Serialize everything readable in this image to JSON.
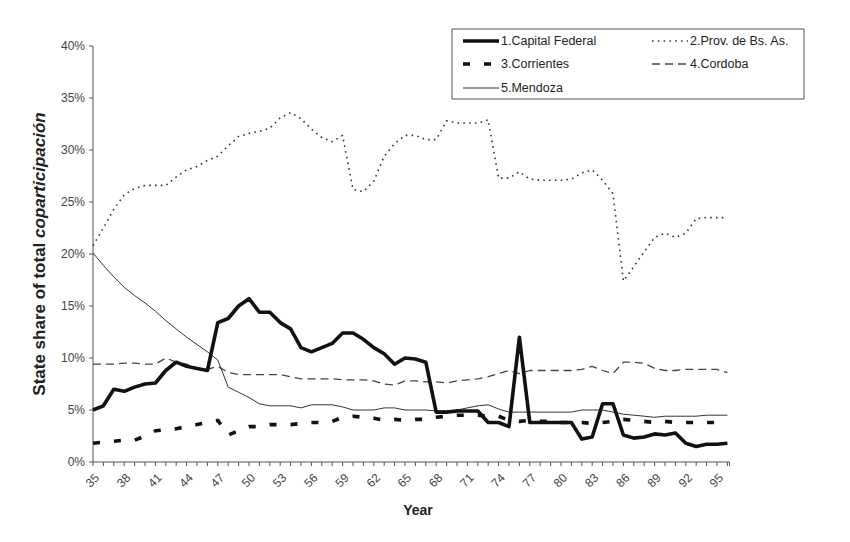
{
  "chart_data": {
    "type": "line",
    "title": "",
    "xlabel": "Year",
    "ylabel_prefix": "State share of total ",
    "ylabel_italic": "coparticipación",
    "ylim": [
      0,
      40
    ],
    "yticks": [
      "0%",
      "5%",
      "10%",
      "15%",
      "20%",
      "25%",
      "30%",
      "35%",
      "40%"
    ],
    "xrange": [
      35,
      96
    ],
    "xtick_labels": [
      "35",
      "38",
      "41",
      "44",
      "47",
      "50",
      "53",
      "56",
      "59",
      "62",
      "65",
      "68",
      "71",
      "74",
      "77",
      "80",
      "83",
      "86",
      "89",
      "92",
      "95"
    ],
    "grid": false,
    "legend_position": "top-right",
    "x": [
      35,
      36,
      37,
      38,
      39,
      40,
      41,
      42,
      43,
      44,
      45,
      46,
      47,
      48,
      49,
      50,
      51,
      52,
      53,
      54,
      55,
      56,
      57,
      58,
      59,
      60,
      61,
      62,
      63,
      64,
      65,
      66,
      67,
      68,
      69,
      70,
      71,
      72,
      73,
      74,
      75,
      76,
      77,
      78,
      79,
      80,
      81,
      82,
      83,
      84,
      85,
      86,
      87,
      88,
      89,
      90,
      91,
      92,
      93,
      94,
      95,
      96
    ],
    "series": [
      {
        "name": "1.Capital Federal",
        "style": "thick-solid",
        "values": [
          5.0,
          5.4,
          7.0,
          6.8,
          7.2,
          7.5,
          7.6,
          8.8,
          9.6,
          9.2,
          9.0,
          8.8,
          13.4,
          13.8,
          15.0,
          15.7,
          14.4,
          14.4,
          13.4,
          12.8,
          11.0,
          10.6,
          11.0,
          11.4,
          12.4,
          12.4,
          11.8,
          11.0,
          10.4,
          9.4,
          10.0,
          9.9,
          9.6,
          4.8,
          4.8,
          4.9,
          4.9,
          4.9,
          3.8,
          3.8,
          3.4,
          12.0,
          3.8,
          3.8,
          3.8,
          3.8,
          3.8,
          2.2,
          2.4,
          5.6,
          5.6,
          2.6,
          2.3,
          2.4,
          2.7,
          2.6,
          2.8,
          1.8,
          1.5,
          1.7,
          1.7,
          1.8
        ]
      },
      {
        "name": "2.Prov. de Bs. As.",
        "style": "dotted",
        "values": [
          20.8,
          22.5,
          24.3,
          25.7,
          26.3,
          26.6,
          26.6,
          26.6,
          27.4,
          28.1,
          28.4,
          29.0,
          29.4,
          30.4,
          31.3,
          31.6,
          31.8,
          32.1,
          33.1,
          33.6,
          33.0,
          32.0,
          31.2,
          30.8,
          31.4,
          26.2,
          26.0,
          27.0,
          29.4,
          30.6,
          31.4,
          31.4,
          31.0,
          31.0,
          32.8,
          32.6,
          32.6,
          32.6,
          32.9,
          27.3,
          27.3,
          27.9,
          27.2,
          27.1,
          27.1,
          27.1,
          27.2,
          27.8,
          28.1,
          27.1,
          25.8,
          17.4,
          18.8,
          20.2,
          21.6,
          22.0,
          21.6,
          22.0,
          23.4,
          23.5,
          23.5,
          23.5
        ]
      },
      {
        "name": "3.Corrientes",
        "style": "thick-dashed",
        "values": [
          1.8,
          1.9,
          2.0,
          2.1,
          2.1,
          2.5,
          3.0,
          3.1,
          3.2,
          3.4,
          3.6,
          3.8,
          4.0,
          2.6,
          3.0,
          3.4,
          3.4,
          3.6,
          3.6,
          3.6,
          3.7,
          3.8,
          3.8,
          3.9,
          4.3,
          4.4,
          4.3,
          4.2,
          4.0,
          4.1,
          4.0,
          4.1,
          4.1,
          4.3,
          4.4,
          4.5,
          4.5,
          4.5,
          4.4,
          4.4,
          4.0,
          3.9,
          4.0,
          3.9,
          3.9,
          3.8,
          3.8,
          3.8,
          3.7,
          3.8,
          3.9,
          4.1,
          4.0,
          3.9,
          3.8,
          3.9,
          3.8,
          3.8,
          3.8,
          3.8,
          3.8,
          3.8
        ]
      },
      {
        "name": "4.Cordoba",
        "style": "dashed",
        "values": [
          9.4,
          9.4,
          9.4,
          9.5,
          9.5,
          9.4,
          9.4,
          10.0,
          9.6,
          9.4,
          9.0,
          8.9,
          9.2,
          8.6,
          8.4,
          8.4,
          8.4,
          8.4,
          8.4,
          8.2,
          8.0,
          8.0,
          8.0,
          8.0,
          7.9,
          7.9,
          7.9,
          7.8,
          7.5,
          7.4,
          7.8,
          7.8,
          7.7,
          7.7,
          7.6,
          7.8,
          7.9,
          8.0,
          8.2,
          8.5,
          8.8,
          8.5,
          8.8,
          8.8,
          8.8,
          8.8,
          8.8,
          8.9,
          9.2,
          8.8,
          8.5,
          9.6,
          9.6,
          9.5,
          9.0,
          8.8,
          8.8,
          8.9,
          8.9,
          8.9,
          8.9,
          8.6
        ]
      },
      {
        "name": "5.Mendoza",
        "style": "thin-solid",
        "values": [
          20.1,
          18.9,
          17.8,
          16.8,
          16.0,
          15.3,
          14.5,
          13.6,
          12.8,
          12.0,
          11.3,
          10.6,
          9.8,
          7.2,
          6.7,
          6.2,
          5.6,
          5.4,
          5.4,
          5.4,
          5.2,
          5.5,
          5.5,
          5.5,
          5.3,
          5.0,
          5.0,
          5.0,
          5.2,
          5.2,
          5.0,
          5.0,
          5.0,
          4.9,
          4.9,
          5.0,
          5.2,
          5.4,
          5.5,
          5.1,
          4.8,
          4.8,
          4.8,
          4.8,
          4.8,
          4.8,
          4.8,
          5.0,
          5.0,
          5.0,
          4.8,
          4.6,
          4.5,
          4.4,
          4.3,
          4.4,
          4.4,
          4.4,
          4.4,
          4.5,
          4.5,
          4.5
        ]
      }
    ]
  }
}
